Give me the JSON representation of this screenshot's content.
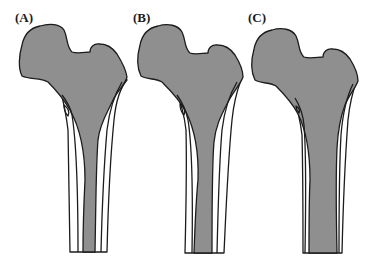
{
  "figure": {
    "panels": [
      {
        "id": "A",
        "label": "(A)"
      },
      {
        "id": "B",
        "label": "(B)"
      },
      {
        "id": "C",
        "label": "(C)"
      }
    ],
    "colors": {
      "marrow_fill": "#8f8f8f",
      "cortex_fill": "#ffffff",
      "outline": "#1c1c1c",
      "background": "#ffffff"
    }
  }
}
